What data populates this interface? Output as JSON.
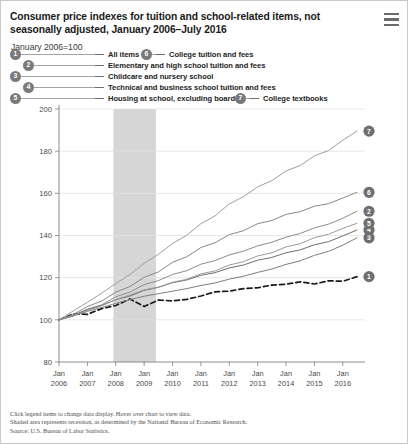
{
  "header": {
    "title": "Consumer price indexes for tuition and school-related items, not seasonally adjusted, January 2006–July 2016",
    "menu_icon": "hamburger-menu-icon",
    "subtitle": "January 2006=100"
  },
  "legend": {
    "items": [
      {
        "num": "1",
        "label": "All items"
      },
      {
        "num": "2",
        "label": "Elementary and high school tuition and fees"
      },
      {
        "num": "3",
        "label": "Childcare and nursery school"
      },
      {
        "num": "4",
        "label": "Technical and business school tuition and fees"
      },
      {
        "num": "5",
        "label": "Housing at school, excluding board"
      },
      {
        "num": "6",
        "label": "College tuition and fees"
      },
      {
        "num": "7",
        "label": "College textbooks"
      }
    ]
  },
  "footer": {
    "line1": "Click legend items to change data display. Hover over chart to view data.",
    "line2": "Shaded area represents recession, as determined by the National Bureau of Economic Research.",
    "line3": "Source: U.S. Bureau of Labor Statistics."
  },
  "chart_data": {
    "type": "line",
    "title": "Consumer price indexes for tuition and school-related items, not seasonally adjusted, January 2006–July 2016",
    "xlabel": "",
    "ylabel": "",
    "ylim": [
      80,
      200
    ],
    "yticks": [
      80,
      100,
      120,
      140,
      160,
      180,
      200
    ],
    "grid": true,
    "legend_position": "top",
    "x_range": [
      "Jan 2006",
      "Jul 2016"
    ],
    "xticks": [
      {
        "l1": "Jan",
        "l2": "2006"
      },
      {
        "l1": "Jan",
        "l2": "2007"
      },
      {
        "l1": "Jan",
        "l2": "2008"
      },
      {
        "l1": "Jan",
        "l2": "2009"
      },
      {
        "l1": "Jan",
        "l2": "2010"
      },
      {
        "l1": "Jan",
        "l2": "2011"
      },
      {
        "l1": "Jan",
        "l2": "2012"
      },
      {
        "l1": "Jan",
        "l2": "2013"
      },
      {
        "l1": "Jan",
        "l2": "2014"
      },
      {
        "l1": "Jan",
        "l2": "2015"
      },
      {
        "l1": "Jan",
        "l2": "2016"
      }
    ],
    "shaded_region": {
      "label": "recession",
      "start": "Dec 2007",
      "end": "Jun 2009",
      "color": "#d6d6d6"
    },
    "x": [
      "2006-01",
      "2006-07",
      "2007-01",
      "2007-07",
      "2008-01",
      "2008-07",
      "2009-01",
      "2009-07",
      "2010-01",
      "2010-07",
      "2011-01",
      "2011-07",
      "2012-01",
      "2012-07",
      "2013-01",
      "2013-07",
      "2014-01",
      "2014-07",
      "2015-01",
      "2015-07",
      "2016-01",
      "2016-07"
    ],
    "series": [
      {
        "num": "1",
        "name": "All items",
        "color": "#1a1a1a",
        "style": "dashed",
        "end_value": 122,
        "values": [
          100.0,
          102.8,
          102.6,
          105.3,
          106.8,
          109.9,
          106.3,
          109.4,
          109.0,
          109.7,
          111.3,
          113.3,
          113.6,
          114.8,
          115.2,
          116.5,
          116.9,
          118.0,
          117.0,
          118.5,
          118.3,
          120.5
        ]
      },
      {
        "num": "2",
        "name": "Elementary and high school tuition and fees",
        "color": "#8c8c8c",
        "style": "solid",
        "end_value": 152,
        "values": [
          100.0,
          101.7,
          105.1,
          107.1,
          110.9,
          113.2,
          116.7,
          118.6,
          121.5,
          123.3,
          126.4,
          128.1,
          130.8,
          132.6,
          135.1,
          136.8,
          139.2,
          141.0,
          143.6,
          145.4,
          148.2,
          151.5
        ]
      },
      {
        "num": "3",
        "name": "Childcare and nursery school",
        "color": "#7d7d7d",
        "style": "solid",
        "end_value": 140,
        "values": [
          100.0,
          101.9,
          104.0,
          105.8,
          107.8,
          109.6,
          111.2,
          112.4,
          113.6,
          114.8,
          116.3,
          117.5,
          119.3,
          120.7,
          122.5,
          124.1,
          126.3,
          128.0,
          130.6,
          132.5,
          135.4,
          138.9
        ]
      },
      {
        "num": "4",
        "name": "Technical and business school tuition and fees",
        "color": "#6e6e6e",
        "style": "solid",
        "end_value": 143,
        "values": [
          100.0,
          102.3,
          104.8,
          106.8,
          109.5,
          111.3,
          114.0,
          115.4,
          117.6,
          118.9,
          121.1,
          122.4,
          124.6,
          126.0,
          128.3,
          129.6,
          131.8,
          133.2,
          135.6,
          137.1,
          139.8,
          142.6
        ]
      },
      {
        "num": "5",
        "name": "Housing at school, excluding board",
        "color": "#9a9a9a",
        "style": "solid",
        "end_value": 146,
        "values": [
          100.0,
          102.0,
          104.5,
          106.6,
          109.6,
          111.8,
          114.2,
          115.5,
          117.8,
          119.2,
          121.8,
          123.2,
          126.0,
          127.6,
          130.3,
          131.8,
          134.6,
          136.1,
          139.0,
          140.6,
          143.4,
          145.8
        ]
      },
      {
        "num": "6",
        "name": "College tuition and fees",
        "color": "#888888",
        "style": "solid",
        "end_value": 161,
        "values": [
          100.0,
          102.5,
          106.3,
          108.9,
          113.1,
          115.8,
          120.2,
          122.7,
          127.3,
          129.9,
          134.3,
          136.6,
          140.4,
          142.3,
          145.6,
          147.1,
          150.0,
          151.3,
          153.9,
          155.1,
          157.8,
          160.5
        ]
      },
      {
        "num": "7",
        "name": "College textbooks",
        "color": "#9e9e9e",
        "style": "solid",
        "end_value": 190,
        "values": [
          100.0,
          104.2,
          108.3,
          112.6,
          117.2,
          121.5,
          126.8,
          131.0,
          136.2,
          140.1,
          145.6,
          149.3,
          155.0,
          158.4,
          163.1,
          166.0,
          170.6,
          173.2,
          177.8,
          180.3,
          185.2,
          189.5
        ]
      }
    ]
  }
}
